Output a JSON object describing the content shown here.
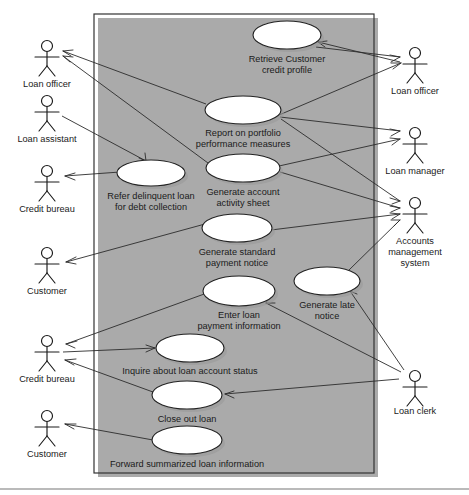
{
  "diagram": {
    "type": "uml-use-case-diagram",
    "system_boundary": {
      "x": 94,
      "y": 14,
      "width": 280,
      "height": 459
    },
    "colors": {
      "background": "#ffffff",
      "line": "#2b2b2b",
      "shape_stroke": "#222222",
      "shape_fill": "#ffffff",
      "shadow": "#9a9a9a",
      "text": "#1a1a1a"
    }
  },
  "actors": [
    {
      "id": "loan-officer-left",
      "label": "Loan officer",
      "side": "left",
      "x": 47,
      "y": 55,
      "label_y": 85
    },
    {
      "id": "loan-assistant",
      "label": "Loan assistant",
      "side": "left",
      "x": 47,
      "y": 110,
      "label_y": 140
    },
    {
      "id": "credit-bureau-upper",
      "label": "Credit bureau",
      "side": "left",
      "x": 47,
      "y": 180,
      "label_y": 210
    },
    {
      "id": "customer-upper",
      "label": "Customer",
      "side": "left",
      "x": 47,
      "y": 262,
      "label_y": 292
    },
    {
      "id": "credit-bureau-lower",
      "label": "Credit bureau",
      "side": "left",
      "x": 47,
      "y": 350,
      "label_y": 380
    },
    {
      "id": "customer-lower",
      "label": "Customer",
      "side": "left",
      "x": 47,
      "y": 425,
      "label_y": 455
    },
    {
      "id": "loan-officer-right",
      "label": "Loan officer",
      "side": "right",
      "x": 415,
      "y": 57,
      "label_y": 92
    },
    {
      "id": "loan-manager",
      "label": "Loan manager",
      "side": "right",
      "x": 415,
      "y": 135,
      "label_y": 172
    },
    {
      "id": "accounts-management-system",
      "label": "Accounts management system",
      "label_lines": [
        "Accounts",
        "management",
        "system"
      ],
      "side": "right",
      "x": 415,
      "y": 205,
      "label_y": 238
    },
    {
      "id": "loan-clerk",
      "label": "Loan clerk",
      "side": "right",
      "x": 415,
      "y": 378,
      "label_y": 412
    }
  ],
  "use_cases": [
    {
      "id": "retrieve-customer-credit-profile",
      "label": "Retrieve Customer credit profile",
      "label_lines": [
        "Retrieve Customer",
        "credit profile"
      ],
      "cx": 287,
      "cy": 35,
      "rx": 34,
      "ry": 14,
      "label_y": 60
    },
    {
      "id": "report-on-portfolio-performance-measures",
      "label": "Report on portfolio performance measures",
      "label_lines": [
        "Report on portfolio",
        "performance measures"
      ],
      "cx": 243,
      "cy": 110,
      "rx": 38,
      "ry": 14,
      "label_y": 134
    },
    {
      "id": "refer-delinquent-loan-for-debt-collection",
      "label": "Refer delinquent loan for debt collection",
      "label_lines": [
        "Refer delinquent loan",
        "for debt collection"
      ],
      "cx": 151,
      "cy": 173,
      "rx": 34,
      "ry": 13,
      "label_y": 197
    },
    {
      "id": "generate-account-activity-sheet",
      "label": "Generate account activity sheet",
      "label_lines": [
        "Generate account",
        "activity sheet"
      ],
      "cx": 243,
      "cy": 168,
      "rx": 37,
      "ry": 14,
      "label_y": 193
    },
    {
      "id": "generate-standard-payment-notice",
      "label": "Generate standard payment notice",
      "label_lines": [
        "Generate standard",
        "payment notice"
      ],
      "cx": 237,
      "cy": 228,
      "rx": 35,
      "ry": 14,
      "label_y": 253
    },
    {
      "id": "enter-loan-payment-information",
      "label": "Enter loan payment information",
      "label_lines": [
        "Enter loan",
        "payment information"
      ],
      "cx": 239,
      "cy": 291,
      "rx": 36,
      "ry": 15,
      "label_y": 316
    },
    {
      "id": "generate-late-notice",
      "label": "Generate late notice",
      "label_lines": [
        "Generate late",
        "notice"
      ],
      "cx": 327,
      "cy": 281,
      "rx": 33,
      "ry": 14,
      "label_y": 306
    },
    {
      "id": "inquire-about-loan-account-status",
      "label": "Inquire about loan account status",
      "label_lines": [
        "Inquire about loan account status"
      ],
      "cx": 190,
      "cy": 348,
      "rx": 34,
      "ry": 14,
      "label_y": 372
    },
    {
      "id": "close-out-loan",
      "label": "Close out loan",
      "label_lines": [
        "Close out loan"
      ],
      "cx": 187,
      "cy": 395,
      "rx": 35,
      "ry": 14,
      "label_y": 420
    },
    {
      "id": "forward-summarized-loan-information",
      "label": "Forward summarized loan information",
      "label_lines": [
        "Forward summarized loan information"
      ],
      "cx": 187,
      "cy": 440,
      "rx": 35,
      "ry": 14,
      "label_y": 465
    }
  ],
  "associations": [
    {
      "from": "report-on-portfolio-performance-measures",
      "to": "loan-officer-left",
      "arrow_at": "to"
    },
    {
      "from": "generate-account-activity-sheet",
      "to": "loan-officer-left",
      "arrow_at": "to"
    },
    {
      "from": "loan-assistant",
      "to": "refer-delinquent-loan-for-debt-collection",
      "arrow_at": "to"
    },
    {
      "from": "refer-delinquent-loan-for-debt-collection",
      "to": "credit-bureau-upper",
      "arrow_at": "to"
    },
    {
      "from": "generate-standard-payment-notice",
      "to": "customer-upper",
      "arrow_at": "to"
    },
    {
      "from": "enter-loan-payment-information",
      "to": "credit-bureau-lower",
      "arrow_at": "to"
    },
    {
      "from": "credit-bureau-lower",
      "to": "inquire-about-loan-account-status",
      "arrow_at": "to"
    },
    {
      "from": "close-out-loan",
      "to": "credit-bureau-lower",
      "arrow_at": "to"
    },
    {
      "from": "forward-summarized-loan-information",
      "to": "customer-lower",
      "arrow_at": "to"
    },
    {
      "from": "loan-officer-right",
      "to": "retrieve-customer-credit-profile",
      "arrow_at": "to"
    },
    {
      "from": "retrieve-customer-credit-profile",
      "to": "loan-officer-right",
      "arrow_at": "to"
    },
    {
      "from": "report-on-portfolio-performance-measures",
      "to": "loan-manager",
      "arrow_at": "to"
    },
    {
      "from": "generate-account-activity-sheet",
      "to": "loan-manager",
      "arrow_at": "to"
    },
    {
      "from": "report-on-portfolio-performance-measures",
      "to": "accounts-management-system",
      "arrow_at": "to"
    },
    {
      "from": "generate-account-activity-sheet",
      "to": "accounts-management-system",
      "arrow_at": "to"
    },
    {
      "from": "generate-standard-payment-notice",
      "to": "accounts-management-system",
      "arrow_at": "to"
    },
    {
      "from": "generate-late-notice",
      "to": "accounts-management-system",
      "arrow_at": "to"
    },
    {
      "from": "loan-clerk",
      "to": "enter-loan-payment-information",
      "arrow_at": "to"
    },
    {
      "from": "loan-clerk",
      "to": "generate-late-notice",
      "arrow_at": "to"
    },
    {
      "from": "loan-clerk",
      "to": "close-out-loan",
      "arrow_at": "to"
    }
  ]
}
